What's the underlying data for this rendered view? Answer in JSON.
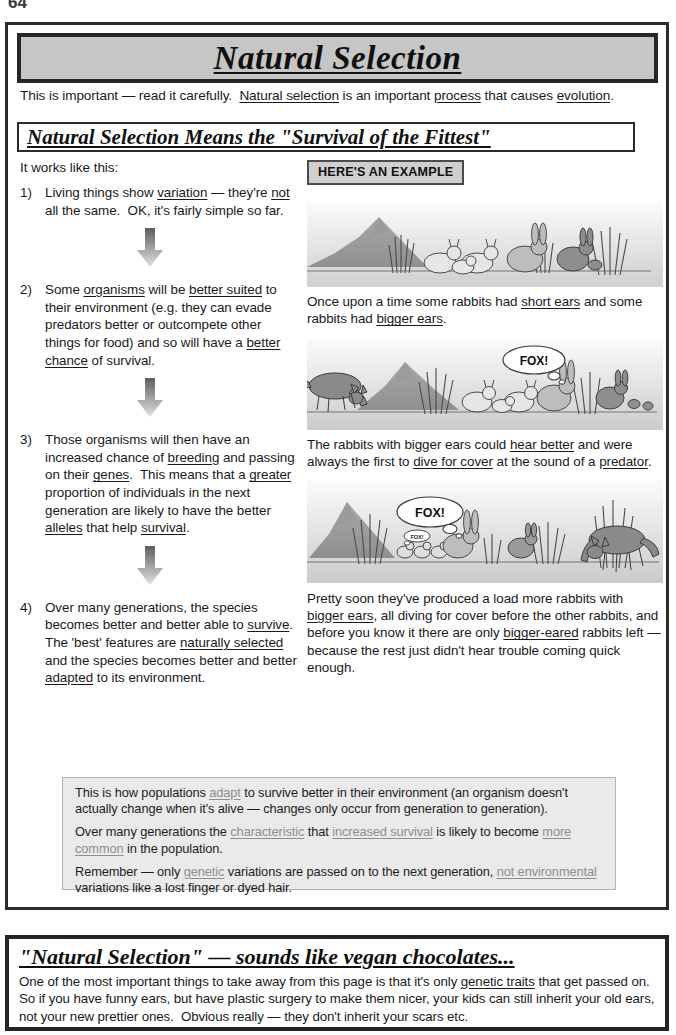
{
  "page": {
    "number": "64"
  },
  "title": {
    "text": "Natural Selection"
  },
  "intro": {
    "text": "This is important — read it carefully.  Natural selection is an important process that causes evolution."
  },
  "section": {
    "heading": "Natural Selection Means the \"Survival of the Fittest\""
  },
  "left_column": {
    "lead_in": "It works like this:",
    "steps": [
      {
        "number": "1)",
        "text": "Living things show variation — they're not all the same.  OK, it's fairly simple so far."
      },
      {
        "number": "2)",
        "text": "Some organisms will be better suited to their environment (e.g. they can evade predators better or outcompete other things for food) and so will have a better chance of survival."
      },
      {
        "number": "3)",
        "text": "Those organisms will then have an increased chance of breeding and passing on their genes.  This means that a greater proportion of individuals in the next generation are likely to have the better alleles that help survival."
      },
      {
        "number": "4)",
        "text": "Over many generations, the species becomes better and better able to survive. The 'best' features are naturally selected and the species becomes better and better adapted to its environment."
      }
    ]
  },
  "right_column": {
    "example_tag": "HERE'S AN EXAMPLE",
    "captions": [
      "Once upon a time some rabbits had short ears and some rabbits had bigger ears.",
      "The rabbits with bigger ears could hear better and were always the first to dive for cover at the sound of a predator.",
      "Pretty soon they've produced a load more rabbits with bigger ears, all diving for cover before the other rabbits, and before you know it there are only bigger-eared rabbits left — because the rest just didn't hear trouble coming quick enough."
    ],
    "illustrations": [
      {
        "name": "rabbits-on-hillside",
        "speech_bubbles": []
      },
      {
        "name": "fox-approaching-rabbits",
        "speech_bubbles": [
          "FOX!"
        ]
      },
      {
        "name": "many-big-eared-rabbits-and-fox",
        "speech_bubbles": [
          "FOX!",
          "FOX!"
        ]
      }
    ]
  },
  "summary_box": {
    "paragraphs": [
      "This is how populations adapt to survive better in their environment (an organism doesn't actually change when it's alive — changes only occur from generation to generation).",
      "Over many generations the characteristic that increased survival is likely to become more common in the population.",
      "Remember — only genetic variations are passed on to the next generation, not environmental variations like a lost finger or dyed hair."
    ]
  },
  "bottom_box": {
    "title": "\"Natural Selection\" — sounds like vegan chocolates...",
    "body": "One of the most important things to take away from this page is that it's only genetic traits that get passed on.  So if you have funny ears, but have plastic surgery to make them nicer, your kids can still inherit your old ears, not your new prettier ones.  Obvious really — they don't inherit your scars etc."
  },
  "colors": {
    "banner_fill": "#c6c6c6",
    "frame": "#2b2b2b",
    "summary_fill": "#eaeaea",
    "tag_fill": "#cfcfcf",
    "grey_underline": "#8d8d8d"
  }
}
